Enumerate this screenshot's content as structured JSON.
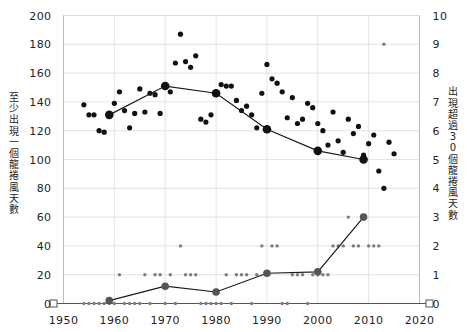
{
  "chart_data": {
    "type": "scatter",
    "title": "",
    "xlabel": "",
    "ylabel": "至少出現一個龍捲風天數",
    "y2label": "出現超過30個龍捲風天數",
    "grid": true,
    "legend": "none",
    "xlim": [
      1950,
      2020
    ],
    "ylim": [
      0,
      200
    ],
    "y2lim": [
      0,
      10
    ],
    "xticks": [
      1950,
      1960,
      1970,
      1980,
      1990,
      2000,
      2010,
      2020
    ],
    "xticklabels": [
      "1950",
      "1960",
      "1970",
      "1980",
      "1990",
      "2000",
      "2010",
      "2020"
    ],
    "yticks": [
      0,
      20,
      40,
      60,
      80,
      100,
      120,
      140,
      160,
      180,
      200
    ],
    "yticklabels": [
      "0",
      "20",
      "40",
      "60",
      "80",
      "100",
      "120",
      "140",
      "160",
      "180",
      "200"
    ],
    "y2ticks": [
      0,
      1,
      2,
      3,
      4,
      5,
      6,
      7,
      8,
      9,
      10
    ],
    "y2ticklabels": [
      "0",
      "1",
      "2",
      "3",
      "4",
      "5",
      "6",
      "7",
      "8",
      "9",
      "10"
    ],
    "series": [
      {
        "name": "至少出現一個龍捲風天數",
        "axis": "left",
        "type": "scatter",
        "marker": "filled-circle-large",
        "color": "#111111",
        "points": [
          [
            1954,
            138
          ],
          [
            1955,
            131
          ],
          [
            1956,
            131
          ],
          [
            1957,
            120
          ],
          [
            1958,
            119
          ],
          [
            1959,
            131
          ],
          [
            1960,
            139
          ],
          [
            1961,
            147
          ],
          [
            1962,
            134
          ],
          [
            1963,
            122
          ],
          [
            1964,
            132
          ],
          [
            1965,
            149
          ],
          [
            1966,
            133
          ],
          [
            1967,
            146
          ],
          [
            1968,
            145
          ],
          [
            1969,
            132
          ],
          [
            1970,
            151
          ],
          [
            1971,
            147
          ],
          [
            1972,
            167
          ],
          [
            1973,
            187
          ],
          [
            1974,
            168
          ],
          [
            1975,
            164
          ],
          [
            1976,
            172
          ],
          [
            1977,
            128
          ],
          [
            1978,
            126
          ],
          [
            1979,
            131
          ],
          [
            1980,
            146
          ],
          [
            1981,
            152
          ],
          [
            1982,
            151
          ],
          [
            1983,
            151
          ],
          [
            1984,
            141
          ],
          [
            1985,
            134
          ],
          [
            1986,
            137
          ],
          [
            1987,
            131
          ],
          [
            1988,
            122
          ],
          [
            1989,
            146
          ],
          [
            1990,
            166
          ],
          [
            1991,
            156
          ],
          [
            1992,
            153
          ],
          [
            1993,
            147
          ],
          [
            1994,
            129
          ],
          [
            1995,
            143
          ],
          [
            1996,
            125
          ],
          [
            1997,
            128
          ],
          [
            1998,
            139
          ],
          [
            1999,
            136
          ],
          [
            2000,
            125
          ],
          [
            2001,
            120
          ],
          [
            2002,
            110
          ],
          [
            2003,
            133
          ],
          [
            2004,
            113
          ],
          [
            2005,
            105
          ],
          [
            2006,
            128
          ],
          [
            2007,
            118
          ],
          [
            2008,
            123
          ],
          [
            2009,
            103
          ],
          [
            2010,
            111
          ],
          [
            2011,
            117
          ],
          [
            2012,
            92
          ],
          [
            2013,
            80
          ],
          [
            2014,
            112
          ],
          [
            2015,
            104
          ]
        ]
      },
      {
        "name": "至少出現一個龍捲風天數 趨勢",
        "axis": "left",
        "type": "line",
        "marker": "filled-circle-xlarge",
        "color": "#111111",
        "points": [
          [
            1959,
            131
          ],
          [
            1970,
            151
          ],
          [
            1980,
            146
          ],
          [
            1990,
            121
          ],
          [
            2000,
            106
          ],
          [
            2009,
            100
          ]
        ]
      },
      {
        "name": "出現超過30個龍捲風天數",
        "axis": "right",
        "type": "scatter",
        "marker": "filled-circle-small",
        "color": "#7d7d7d",
        "points": [
          [
            1954,
            0
          ],
          [
            1955,
            0
          ],
          [
            1956,
            0
          ],
          [
            1957,
            0
          ],
          [
            1958,
            0
          ],
          [
            1959,
            0
          ],
          [
            1960,
            0
          ],
          [
            1961,
            1
          ],
          [
            1962,
            0
          ],
          [
            1963,
            0
          ],
          [
            1964,
            0
          ],
          [
            1965,
            0
          ],
          [
            1966,
            1
          ],
          [
            1967,
            0
          ],
          [
            1968,
            1
          ],
          [
            1969,
            1
          ],
          [
            1970,
            0
          ],
          [
            1971,
            1
          ],
          [
            1972,
            0
          ],
          [
            1973,
            2
          ],
          [
            1974,
            1
          ],
          [
            1975,
            1
          ],
          [
            1976,
            1
          ],
          [
            1977,
            0
          ],
          [
            1978,
            0
          ],
          [
            1979,
            0
          ],
          [
            1980,
            0
          ],
          [
            1981,
            0
          ],
          [
            1982,
            1
          ],
          [
            1983,
            0
          ],
          [
            1984,
            1
          ],
          [
            1985,
            1
          ],
          [
            1986,
            1
          ],
          [
            1987,
            0
          ],
          [
            1988,
            1
          ],
          [
            1989,
            2
          ],
          [
            1990,
            1
          ],
          [
            1991,
            2
          ],
          [
            1992,
            2
          ],
          [
            1993,
            0
          ],
          [
            1994,
            0
          ],
          [
            1995,
            1
          ],
          [
            1996,
            1
          ],
          [
            1997,
            1
          ],
          [
            1998,
            0
          ],
          [
            1999,
            1
          ],
          [
            2000,
            1
          ],
          [
            2001,
            1
          ],
          [
            2002,
            1
          ],
          [
            2003,
            2
          ],
          [
            2004,
            2
          ],
          [
            2005,
            2
          ],
          [
            2006,
            3
          ],
          [
            2007,
            2
          ],
          [
            2008,
            2
          ],
          [
            2009,
            3
          ],
          [
            2010,
            2
          ],
          [
            2011,
            2
          ],
          [
            2012,
            2
          ],
          [
            2013,
            9
          ]
        ]
      },
      {
        "name": "出現超過30個龍捲風天數 趨勢",
        "axis": "right",
        "type": "line",
        "marker": "filled-circle-large",
        "color": "#444444",
        "points": [
          [
            1959,
            0.1
          ],
          [
            1970,
            0.6
          ],
          [
            1980,
            0.4
          ],
          [
            1990,
            1.05
          ],
          [
            2000,
            1.1
          ],
          [
            2009,
            3.0
          ]
        ]
      }
    ]
  }
}
